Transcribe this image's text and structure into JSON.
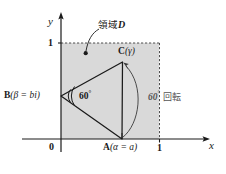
{
  "figure": {
    "caption_language": "ja",
    "axes": {
      "x_label": "x",
      "y_label": "y",
      "origin_label": "0",
      "x_tick_label": "1",
      "y_tick_label": "1"
    },
    "region": {
      "annotation_label": "領域",
      "annotation_symbol": "D",
      "fill_color": "#d9d9d9",
      "border_style": "dashed"
    },
    "points": {
      "a": {
        "name": "A",
        "label": "A(α = a)",
        "label_point": "A",
        "label_expr": "(α = a)"
      },
      "b": {
        "name": "B",
        "label": "B(β = bi)",
        "label_point": "B",
        "label_expr": "(β = bi)"
      },
      "c": {
        "name": "C",
        "label": "C(γ)",
        "label_point": "C",
        "label_expr": "(γ)"
      }
    },
    "angle_marker": {
      "value": "60",
      "degree_symbol": "°",
      "at_vertex": "B"
    },
    "rotation_annotation": {
      "value": "60",
      "degree_symbol": "°",
      "text": "回転",
      "full": "60° 回転"
    },
    "stroke_color": "#1a1a1a",
    "background": "#ffffff"
  }
}
